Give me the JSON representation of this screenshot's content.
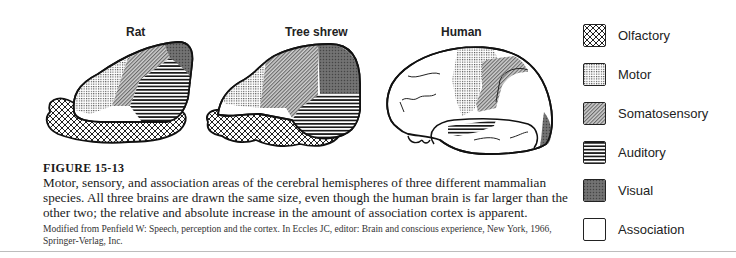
{
  "figure": {
    "panels": [
      {
        "title": "Rat"
      },
      {
        "title": "Tree shrew"
      },
      {
        "title": "Human"
      }
    ],
    "legend": [
      {
        "label": "Olfactory",
        "pattern": "crosshatch"
      },
      {
        "label": "Motor",
        "pattern": "fine-grid"
      },
      {
        "label": "Somatosensory",
        "pattern": "diagonal"
      },
      {
        "label": "Auditory",
        "pattern": "horizontal-lines"
      },
      {
        "label": "Visual",
        "pattern": "dark-stipple"
      },
      {
        "label": "Association",
        "pattern": "blank"
      }
    ],
    "caption": {
      "number": "FIGURE 15-13",
      "text": "Motor, sensory, and association areas of the cerebral hemispheres of three different mammalian species. All three brains are drawn the same size, even though the human brain is far larger than the other two; the relative and absolute increase in the amount of association cortex is apparent.",
      "credit": "Modified from Penfield W: Speech, perception and the cortex. In Eccles JC, editor: Brain and conscious experience, New York, 1966, Springer-Verlag, Inc."
    }
  }
}
